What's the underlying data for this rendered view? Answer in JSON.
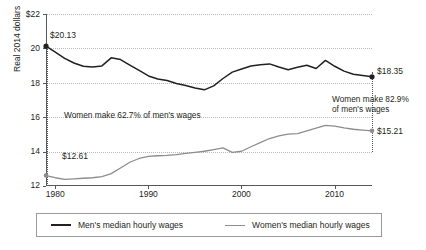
{
  "chart_data": {
    "type": "line",
    "title": "",
    "xlabel": "",
    "ylabel": "Real 2014 dollars",
    "xlim": [
      1979,
      2014
    ],
    "ylim": [
      12,
      22
    ],
    "grid": true,
    "legend_position": "bottom",
    "y_ticks": [
      "$22",
      "20",
      "18",
      "16",
      "14",
      "12"
    ],
    "y_tick_values": [
      22,
      20,
      18,
      16,
      14,
      12
    ],
    "x_ticks": [
      "1980",
      "1990",
      "2000",
      "2010"
    ],
    "x_tick_values": [
      1980,
      1990,
      2000,
      2010
    ],
    "x": [
      1979,
      1980,
      1981,
      1982,
      1983,
      1984,
      1985,
      1986,
      1987,
      1988,
      1989,
      1990,
      1991,
      1992,
      1993,
      1994,
      1995,
      1996,
      1997,
      1998,
      1999,
      2000,
      2001,
      2002,
      2003,
      2004,
      2005,
      2006,
      2007,
      2008,
      2009,
      2010,
      2011,
      2012,
      2013,
      2014
    ],
    "series": [
      {
        "name": "Men's median hourly wages",
        "color": "#231f20",
        "values": [
          20.13,
          19.78,
          19.42,
          19.15,
          18.96,
          18.92,
          18.98,
          19.45,
          19.35,
          19.03,
          18.72,
          18.4,
          18.22,
          18.13,
          17.96,
          17.84,
          17.7,
          17.59,
          17.82,
          18.25,
          18.62,
          18.8,
          18.98,
          19.05,
          19.1,
          18.92,
          18.76,
          18.9,
          19.02,
          18.83,
          19.3,
          18.96,
          18.68,
          18.5,
          18.42,
          18.35
        ],
        "start_label": "$20.13",
        "end_label": "$18.35"
      },
      {
        "name": "Women's median hourly wages",
        "color": "#8d8d8f",
        "values": [
          12.61,
          12.48,
          12.38,
          12.42,
          12.45,
          12.48,
          12.55,
          12.72,
          13.05,
          13.38,
          13.6,
          13.72,
          13.76,
          13.78,
          13.82,
          13.9,
          13.96,
          14.02,
          14.12,
          14.22,
          13.96,
          14.02,
          14.28,
          14.52,
          14.76,
          14.92,
          15.02,
          15.05,
          15.2,
          15.36,
          15.52,
          15.48,
          15.38,
          15.3,
          15.25,
          15.21
        ],
        "start_label": "$12.61",
        "end_label": "$15.21"
      }
    ],
    "annotations": [
      {
        "text": "Women make 62.7% of men's wages",
        "at_x": 1979,
        "ratio": 62.7
      },
      {
        "text_line1": "Women make 82.9%",
        "text_line2": "of men's wages",
        "at_x": 2014,
        "ratio": 82.9
      }
    ]
  },
  "axis": {
    "y_title": "Real 2014 dollars",
    "y_labels": [
      "$22",
      "20",
      "18",
      "16",
      "14",
      "12"
    ],
    "x_labels": [
      "1980",
      "1990",
      "2000",
      "2010"
    ]
  },
  "labels": {
    "men_start": "$20.13",
    "men_end": "$18.35",
    "women_start": "$12.61",
    "women_end": "$15.21",
    "annotation_left": "Women make 62.7% of men's wages",
    "annotation_right_line1": "Women make 82.9%",
    "annotation_right_line2": "of men's wages"
  },
  "legend": {
    "men_label": "Men's median hourly wages",
    "women_label": "Women's median hourly wages"
  },
  "colors": {
    "men_line": "#231f20",
    "women_line": "#8d8d8f",
    "grid": "#b9b9bb",
    "axis": "#58585a",
    "background": "#ffffff"
  }
}
